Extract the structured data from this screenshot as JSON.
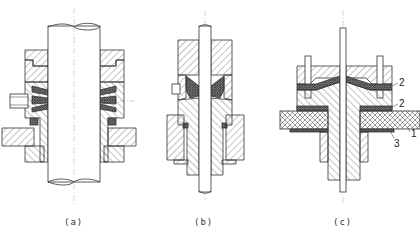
{
  "figure": {
    "panels": [
      {
        "id": "a",
        "label": "(a)"
      },
      {
        "id": "b",
        "label": "(b)"
      },
      {
        "id": "c",
        "label": "(c)"
      }
    ],
    "callouts": [
      "2",
      "2",
      "1",
      "3"
    ],
    "colors": {
      "line": "#333333",
      "hatch": "#555555",
      "background": "#ffffff",
      "seal": "#444444"
    }
  }
}
